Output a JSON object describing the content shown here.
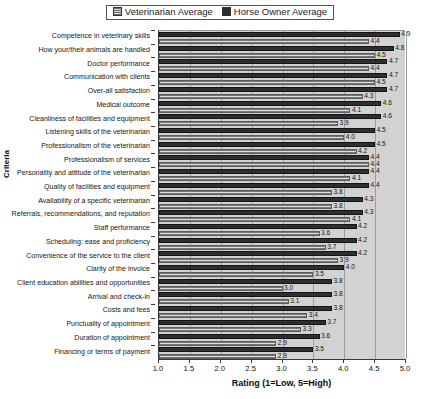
{
  "chart_data": {
    "type": "bar",
    "orientation": "horizontal",
    "title": "",
    "xlabel": "Rating (1=Low, 5=High)",
    "ylabel": "Criteria",
    "xlim": [
      1.0,
      5.0
    ],
    "xticks": [
      "1.0",
      "1.5",
      "2.0",
      "2.5",
      "3.0",
      "3.5",
      "4.0",
      "4.5",
      "5.0"
    ],
    "grid": true,
    "legend_position": "top-center",
    "categories": [
      "Competence in veterinary skills",
      "How your/their animals are handled",
      "Doctor performance",
      "Communication with clients",
      "Over-all satisfaction",
      "Medical outcome",
      "Cleanliness of facilities and equipment",
      "Listening skills of the veterinarian",
      "Professionalism of the veterinarian",
      "Professionalism of services",
      "Personality and attitude of the veterinarian",
      "Quality of facilities and equipment",
      "Availability of a specific veterinarian",
      "Referrals, recommendations, and reputation",
      "Staff performance",
      "Scheduling: ease and proficiency",
      "Convenience of the service to the client",
      "Clarity of the invoice",
      "Client education abilities and opportunities",
      "Arrival and check-in",
      "Costs and fees",
      "Punctuality of appointment",
      "Duration of appointment",
      "Financing or terms of payment"
    ],
    "series": [
      {
        "name": "Horse Owner Average",
        "color": "#2e2e2e",
        "values": [
          4.9,
          4.8,
          4.7,
          4.7,
          4.7,
          4.6,
          4.6,
          4.5,
          4.5,
          4.4,
          4.4,
          4.4,
          4.3,
          4.3,
          4.2,
          4.2,
          4.2,
          4.0,
          3.8,
          3.8,
          3.8,
          3.7,
          3.6,
          3.5
        ],
        "labels": [
          "4.9",
          "4.8",
          "4.7",
          "4.7",
          "4.7",
          "4.6",
          "4.6",
          "4.5",
          "4.5",
          "4.4",
          "4.4",
          "4.4",
          "4.3",
          "4.3",
          "4.2",
          "4.2",
          "4.2",
          "4.0",
          "3.8",
          "3.8",
          "3.8",
          "3.7",
          "3.6",
          "3.5"
        ]
      },
      {
        "name": "Veterinarian Average",
        "color": "#bdbdbd",
        "values": [
          4.4,
          4.5,
          4.4,
          4.5,
          4.3,
          4.1,
          3.9,
          4.0,
          4.2,
          4.4,
          4.1,
          3.8,
          3.8,
          4.1,
          3.6,
          3.7,
          3.9,
          3.5,
          3.0,
          3.1,
          3.4,
          3.3,
          2.9,
          2.9
        ],
        "labels": [
          "4.4",
          "4.5",
          "4.4",
          "4.5",
          "4.3",
          "4.1",
          "3.9",
          "4.0",
          "4.2",
          "4.4",
          "4.1",
          "3.8",
          "3.8",
          "4.1",
          "3.6",
          "3.7",
          "3.9",
          "3.5",
          "3.0",
          "3.1",
          "3.4",
          "3.3",
          "2.9",
          "2.9"
        ]
      }
    ]
  },
  "legend": {
    "entries": [
      {
        "label": "Veterinarian Average",
        "swatch": "vet"
      },
      {
        "label": "Horse Owner Average",
        "swatch": "owner"
      }
    ]
  }
}
